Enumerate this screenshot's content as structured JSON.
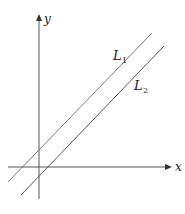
{
  "diagram": {
    "title": "",
    "axes": {
      "x_label": "x",
      "y_label": "y",
      "color": "#555555"
    },
    "lines": [
      {
        "name": "L",
        "subscript": "1",
        "color": "#7a7a7a"
      },
      {
        "name": "L",
        "subscript": "2",
        "color": "#555555"
      }
    ]
  }
}
